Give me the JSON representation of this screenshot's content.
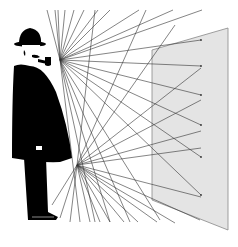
{
  "illustration": {
    "subject": "man-in-bowler-hat-with-pipe",
    "panel_fill": "#e4e4e4",
    "panel_stroke": "#888888",
    "figure_fill": "#000000",
    "ray_stroke": "#333333",
    "background": "#ffffff",
    "eye_origin": [
      60,
      60
    ],
    "hand_origin": [
      77,
      165
    ]
  }
}
